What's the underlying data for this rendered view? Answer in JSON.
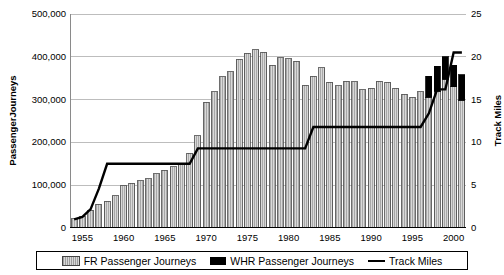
{
  "axes": {
    "left_title": "PassengerJourneys",
    "right_title": "Track Miles",
    "left_ticks": [
      "500,000",
      "400,000",
      "300,000",
      "200,000",
      "100,000",
      "0"
    ],
    "right_ticks": [
      "25",
      "20",
      "15",
      "10",
      "5",
      "0"
    ],
    "x_ticks": [
      "1955",
      "1960",
      "1965",
      "1970",
      "1975",
      "1980",
      "1985",
      "1990",
      "1995",
      "2000"
    ]
  },
  "legend": {
    "items": [
      {
        "label": "FR Passenger Journeys",
        "swatch": "fr-swatch",
        "color": "#c8c8c8"
      },
      {
        "label": "WHR Passenger Journeys",
        "swatch": "whr-swatch",
        "color": "#000000"
      },
      {
        "label": "Track Miles",
        "swatch": "track-miles-line",
        "color": "#000000"
      }
    ]
  },
  "chart_data": {
    "type": "bar",
    "title": "",
    "xlabel": "",
    "ylabel": "PassengerJourneys",
    "y2label": "Track Miles",
    "ylim": [
      0,
      500000
    ],
    "y2lim": [
      0,
      25
    ],
    "xlim": [
      1953.5,
      2001.5
    ],
    "grid": true,
    "legend_position": "bottom",
    "x": [
      1954,
      1955,
      1956,
      1957,
      1958,
      1959,
      1960,
      1961,
      1962,
      1963,
      1964,
      1965,
      1966,
      1967,
      1968,
      1969,
      1970,
      1971,
      1972,
      1973,
      1974,
      1975,
      1976,
      1977,
      1978,
      1979,
      1980,
      1981,
      1982,
      1983,
      1984,
      1985,
      1986,
      1987,
      1988,
      1989,
      1990,
      1991,
      1992,
      1993,
      1994,
      1995,
      1996,
      1997,
      1998,
      1999,
      2000,
      2001
    ],
    "series": [
      {
        "name": "FR Passenger Journeys",
        "type": "bar",
        "axis": "left",
        "color": "#c8c8c8",
        "values": [
          22000,
          28000,
          42000,
          55000,
          62000,
          75000,
          99000,
          105000,
          110000,
          115000,
          127000,
          135000,
          143000,
          150000,
          175000,
          215000,
          294000,
          318000,
          353000,
          365000,
          394000,
          408000,
          417000,
          411000,
          380000,
          398000,
          396000,
          390000,
          334000,
          355000,
          375000,
          340000,
          332000,
          343000,
          342000,
          323000,
          327000,
          343000,
          341000,
          326000,
          312000,
          305000,
          318000,
          306000,
          320000,
          348000,
          330000,
          298000
        ]
      },
      {
        "name": "WHR Passenger Journeys",
        "type": "bar",
        "axis": "left",
        "color": "#000000",
        "values": [
          0,
          0,
          0,
          0,
          0,
          0,
          0,
          0,
          0,
          0,
          0,
          0,
          0,
          0,
          0,
          0,
          0,
          0,
          0,
          0,
          0,
          0,
          0,
          0,
          0,
          0,
          0,
          0,
          0,
          0,
          0,
          0,
          0,
          0,
          0,
          0,
          0,
          0,
          0,
          0,
          0,
          0,
          0,
          48000,
          58000,
          52000,
          50000,
          60000
        ]
      },
      {
        "name": "Track Miles",
        "type": "line",
        "axis": "right",
        "color": "#000000",
        "values": [
          1.0,
          1.3,
          2.2,
          4.6,
          7.5,
          7.5,
          7.5,
          7.5,
          7.5,
          7.5,
          7.5,
          7.5,
          7.5,
          7.5,
          7.5,
          9.3,
          9.3,
          9.3,
          9.3,
          9.3,
          9.3,
          9.3,
          9.3,
          9.3,
          9.3,
          9.3,
          9.3,
          9.3,
          9.3,
          11.8,
          11.8,
          11.8,
          11.8,
          11.8,
          11.8,
          11.8,
          11.8,
          11.8,
          11.8,
          11.8,
          11.8,
          11.8,
          11.8,
          13.4,
          16.2,
          16.2,
          20.5,
          20.5
        ]
      }
    ]
  }
}
